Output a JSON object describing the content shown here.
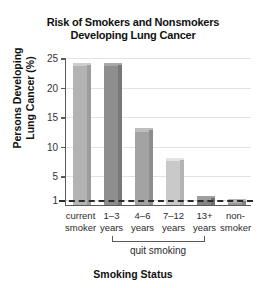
{
  "chart_data": {
    "type": "bar",
    "title": "Risk of Smokers and Nonsmokers Developing Lung Cancer",
    "title_lines": [
      "Risk of Smokers and Nonsmokers",
      "Developing Lung Cancer"
    ],
    "xlabel": "Smoking Status",
    "ylabel": "Persons Developing Lung Cancer (%)",
    "ylabel_lines": [
      "Persons Developing",
      "Lung Cancer (%)"
    ],
    "categories": [
      "current smoker",
      "1–3 years",
      "4–6 years",
      "7–12 years",
      "13+ years",
      "non-smoker"
    ],
    "category_lines": [
      [
        "current",
        "smoker"
      ],
      [
        "1–3",
        "years"
      ],
      [
        "4–6",
        "years"
      ],
      [
        "7–12",
        "years"
      ],
      [
        "13+",
        "years"
      ],
      [
        "non-",
        "smoker"
      ]
    ],
    "values": [
      24,
      24,
      13,
      8,
      1.5,
      1
    ],
    "bar_colors": [
      "#b3b3b3",
      "#8e8e8e",
      "#a3a3a3",
      "#c9c9c9",
      "#858585",
      "#9b9b9b"
    ],
    "ylim": [
      0,
      25
    ],
    "yticks": [
      25,
      20,
      15,
      10,
      5,
      1
    ],
    "ytick_labels": [
      "25",
      "20",
      "15",
      "10",
      "5",
      "1"
    ],
    "grid": true,
    "legend": "none",
    "threshold_line": {
      "value": 1,
      "style": "dashed",
      "color": "#2b2b2b"
    },
    "annotations": [
      {
        "text": "quit smoking",
        "spans_categories": [
          "1–3 years",
          "13+ years"
        ],
        "type": "bracket"
      }
    ]
  }
}
